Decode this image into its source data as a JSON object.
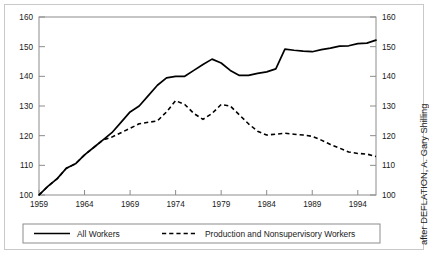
{
  "credit": {
    "text": "after DEFLATION, A. Gary Shilling"
  },
  "legend": {
    "items": [
      {
        "label": "All Workers",
        "style": "solid",
        "color": "#000000"
      },
      {
        "label": "Production and Nonsupervisory Workers",
        "style": "dashed",
        "color": "#000000"
      }
    ]
  },
  "chart_data": {
    "type": "line",
    "title": "",
    "subtitle": "",
    "xlabel": "",
    "ylabel": "",
    "xlim": [
      1959,
      1996
    ],
    "ylim": [
      100,
      160
    ],
    "ytick_step": 10,
    "xtick_step": 5,
    "grid": false,
    "left_axis_ticks": [
      100,
      110,
      120,
      130,
      140,
      150,
      160
    ],
    "right_axis_ticks": [
      100,
      110,
      120,
      130,
      140,
      150,
      160
    ],
    "xtick_labels": [
      "1959",
      "1964",
      "1969",
      "1974",
      "1979",
      "1984",
      "1989",
      "1994"
    ],
    "xtick_values": [
      1959,
      1964,
      1969,
      1974,
      1979,
      1984,
      1989,
      1994
    ],
    "legend_position": "below-axes",
    "annotations": [
      "after DEFLATION, A. Gary Shilling"
    ],
    "x": [
      1959,
      1960,
      1961,
      1962,
      1963,
      1964,
      1965,
      1966,
      1967,
      1968,
      1969,
      1970,
      1971,
      1972,
      1973,
      1974,
      1975,
      1976,
      1977,
      1978,
      1979,
      1980,
      1981,
      1982,
      1983,
      1984,
      1985,
      1986,
      1987,
      1988,
      1989,
      1990,
      1991,
      1992,
      1993,
      1994,
      1995,
      1996
    ],
    "series": [
      {
        "name": "All Workers",
        "style": "solid",
        "values": [
          100.0,
          103.0,
          105.5,
          109.0,
          110.5,
          113.5,
          116.0,
          118.5,
          121.0,
          124.5,
          128.0,
          130.0,
          133.5,
          137.0,
          139.5,
          140.0,
          140.0,
          142.0,
          144.0,
          145.8,
          144.5,
          142.0,
          140.3,
          140.3,
          141.0,
          141.5,
          142.5,
          149.2,
          148.8,
          148.5,
          148.3,
          149.0,
          149.5,
          150.2,
          150.3,
          151.0,
          151.2,
          152.2
        ]
      },
      {
        "name": "Production and Nonsupervisory Workers",
        "style": "dashed",
        "values": [
          100.0,
          103.0,
          105.5,
          109.0,
          110.5,
          113.5,
          116.0,
          118.5,
          119.5,
          121.0,
          122.5,
          124.0,
          124.5,
          125.0,
          128.0,
          131.8,
          130.5,
          127.5,
          125.5,
          127.5,
          130.5,
          130.0,
          127.0,
          124.0,
          121.5,
          120.2,
          120.5,
          120.8,
          120.5,
          120.2,
          119.8,
          118.5,
          117.0,
          115.8,
          114.5,
          114.0,
          113.8,
          113.0
        ]
      }
    ]
  }
}
